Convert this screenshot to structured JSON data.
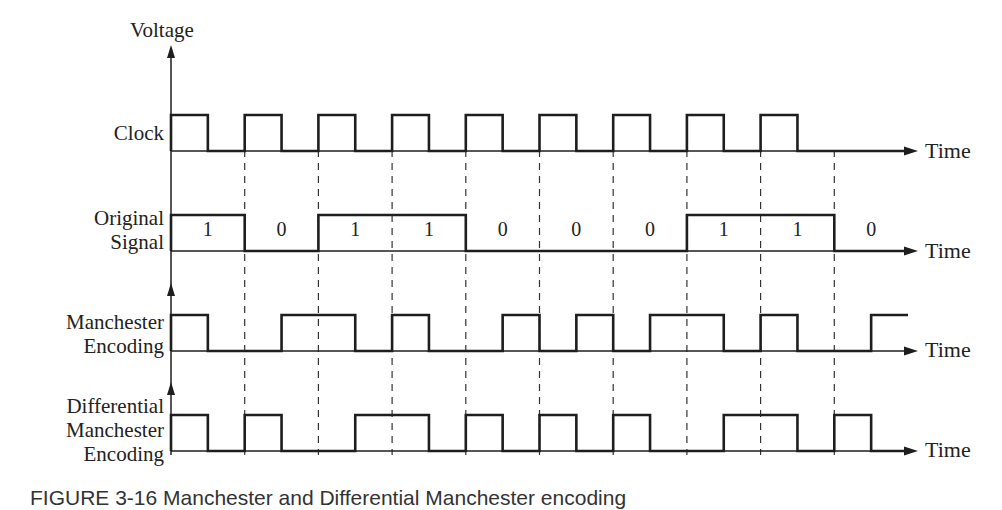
{
  "diagram": {
    "y_axis_label": "Voltage",
    "time_label": "Time",
    "bits": [
      "1",
      "0",
      "1",
      "1",
      "0",
      "0",
      "0",
      "1",
      "1",
      "0"
    ],
    "rows": [
      {
        "id": "clock",
        "label_lines": [
          "Clock"
        ]
      },
      {
        "id": "original",
        "label_lines": [
          "Original",
          "Signal"
        ]
      },
      {
        "id": "manchester",
        "label_lines": [
          "Manchester",
          "Encoding"
        ]
      },
      {
        "id": "diff",
        "label_lines": [
          "Differential",
          "Manchester",
          "Encoding"
        ]
      }
    ],
    "caption": "FIGURE 3-16 Manchester and Differential Manchester encoding"
  },
  "chart_data": {
    "type": "line",
    "xlabel": "Time",
    "ylabel": "Voltage",
    "bit_sequence": [
      1,
      0,
      1,
      1,
      0,
      0,
      0,
      1,
      1,
      0
    ],
    "series": [
      {
        "name": "Clock",
        "half_bit_levels": [
          1,
          0,
          1,
          0,
          1,
          0,
          1,
          0,
          1,
          0,
          1,
          0,
          1,
          0,
          1,
          0,
          1,
          0,
          0,
          0
        ]
      },
      {
        "name": "Original Signal",
        "bit_levels": [
          1,
          0,
          1,
          1,
          0,
          0,
          0,
          1,
          1,
          0
        ]
      },
      {
        "name": "Manchester Encoding",
        "half_bit_levels": [
          1,
          0,
          0,
          1,
          1,
          0,
          1,
          0,
          0,
          1,
          0,
          1,
          0,
          1,
          1,
          0,
          1,
          0,
          0,
          1
        ]
      },
      {
        "name": "Differential Manchester Encoding",
        "half_bit_levels": [
          1,
          0,
          1,
          0,
          0,
          1,
          1,
          0,
          1,
          0,
          1,
          0,
          1,
          0,
          0,
          1,
          1,
          0,
          1,
          0
        ]
      }
    ],
    "grid": "dashed vertical lines at bit boundaries"
  }
}
